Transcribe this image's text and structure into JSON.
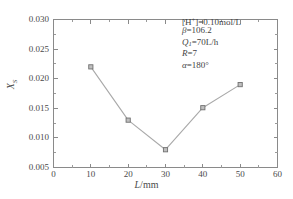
{
  "chart_data": {
    "type": "line",
    "title": "",
    "subtitle": "",
    "xlabel": "L/mm",
    "ylabel": "XS",
    "xlim": [
      0,
      60
    ],
    "ylim": [
      0.005,
      0.03
    ],
    "grid": false,
    "legend_position": "none",
    "marker": "square",
    "x": [
      10,
      20,
      30,
      40,
      50
    ],
    "values": [
      0.022,
      0.013,
      0.008,
      0.0151,
      0.019
    ],
    "series": [
      {
        "name": "XS",
        "x": [
          10,
          20,
          30,
          40,
          50
        ],
        "values": [
          0.022,
          0.013,
          0.008,
          0.0151,
          0.019
        ]
      }
    ],
    "x_tick_labels": [
      "0",
      "10",
      "20",
      "30",
      "40",
      "50",
      "60"
    ],
    "x_tick_values": [
      0,
      10,
      20,
      30,
      40,
      50,
      60
    ],
    "y_tick_labels": [
      "0.005",
      "0.010",
      "0.015",
      "0.020",
      "0.025",
      "0.030"
    ],
    "y_tick_values": [
      0.005,
      0.01,
      0.015,
      0.02,
      0.025,
      0.03
    ],
    "annotations": [
      "[H+]=0.10mol/L",
      "β=106.2",
      "Q1=70L/h",
      "R=7",
      "α=180°"
    ],
    "colors": {
      "line": "#a9a9a9",
      "marker_fill": "#bfbfbf",
      "marker_edge": "#707070",
      "axis": "#8a8a8a",
      "text": "#4a4a4a",
      "background": "#ffffff"
    }
  },
  "axes": {
    "x_title_italic": "L",
    "x_title_rest": "/mm",
    "y_title_italic": "X",
    "y_title_sub": "S"
  },
  "annotation_lines": {
    "line1_prefix": "[H",
    "line1_sup": "+",
    "line1_rest": "]=0.10mol/L",
    "line2_sym": "β",
    "line2_rest": "=106.2",
    "line3_sym": "Q",
    "line3_sub": "1",
    "line3_rest": "=70L/h",
    "line4_sym": "R",
    "line4_rest": "=7",
    "line5_sym": "α",
    "line5_rest": "=180°"
  }
}
